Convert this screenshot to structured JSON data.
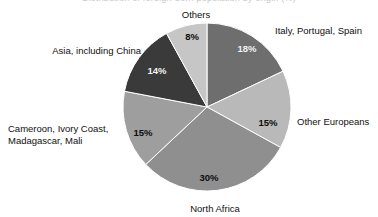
{
  "figure": {
    "clipped_title": "Distribution of foreign-born population by origin (%)",
    "background": "#ffffff"
  },
  "chart_data": {
    "type": "pie",
    "title": "",
    "xlabel": "",
    "ylabel": "",
    "legend_position": "none",
    "grid": false,
    "start_angle_deg": 0,
    "direction": "clockwise",
    "categories": [
      "Italy, Portugal, Spain",
      "Other Europeans",
      "North Africa",
      "Cameroon, Ivory Coast, Madagascar, Mali",
      "Asia, including China",
      "Others"
    ],
    "values": [
      18,
      15,
      30,
      15,
      14,
      8
    ],
    "value_labels": [
      "18%",
      "15%",
      "30%",
      "15%",
      "14%",
      "8%"
    ],
    "colors": [
      "#6e6e6e",
      "#b9b9b9",
      "#8f8f8f",
      "#9e9e9e",
      "#3a3a3a",
      "#c6c6c6"
    ],
    "slices": [
      {
        "name": "Italy, Portugal, Spain",
        "value": 18,
        "value_label": "18%",
        "color": "#6e6e6e",
        "label": "Italy, Portugal, Spain",
        "label_lines": [
          "Italy, Portugal, Spain"
        ],
        "value_text_tone": "on-dark"
      },
      {
        "name": "Other Europeans",
        "value": 15,
        "value_label": "15%",
        "color": "#b9b9b9",
        "label": "Other Europeans",
        "label_lines": [
          "Other Europeans"
        ],
        "value_text_tone": "on-light"
      },
      {
        "name": "North Africa",
        "value": 30,
        "value_label": "30%",
        "color": "#8f8f8f",
        "label": "North Africa",
        "label_lines": [
          "North Africa"
        ],
        "value_text_tone": "on-light"
      },
      {
        "name": "Cameroon, Ivory Coast, Madagascar, Mali",
        "value": 15,
        "value_label": "15%",
        "color": "#9e9e9e",
        "label": "Cameroon, Ivory Coast, Madagascar, Mali",
        "label_lines": [
          "Cameroon, Ivory Coast,",
          "Madagascar, Mali"
        ],
        "value_text_tone": "on-light"
      },
      {
        "name": "Asia, including China",
        "value": 14,
        "value_label": "14%",
        "color": "#3a3a3a",
        "label": "Asia, including China",
        "label_lines": [
          "Asia, including China"
        ],
        "value_text_tone": "on-dark"
      },
      {
        "name": "Others",
        "value": 8,
        "value_label": "8%",
        "color": "#c6c6c6",
        "label": "Others",
        "label_lines": [
          "Others"
        ],
        "value_text_tone": "on-light"
      }
    ],
    "geometry": {
      "center_x": 207,
      "center_y": 107,
      "radius": 84
    }
  },
  "labels": {
    "italy": "Italy, Portugal, Spain",
    "other_europeans": "Other Europeans",
    "north_africa": "North Africa",
    "cameroon_line1": "Cameroon, Ivory Coast,",
    "cameroon_line2": "Madagascar, Mali",
    "asia": "Asia, including China",
    "others": "Others"
  },
  "values": {
    "italy": "18%",
    "other_europeans": "15%",
    "north_africa": "30%",
    "cameroon": "15%",
    "asia": "14%",
    "others": "8%"
  }
}
